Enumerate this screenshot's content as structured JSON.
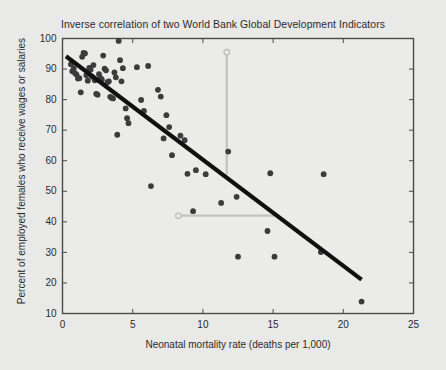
{
  "chart_data": {
    "type": "scatter",
    "title": "Inverse correlation of two World Bank Global Development Indicators",
    "xlabel": "Neonatal mortality rate (deaths per 1,000)",
    "ylabel": "Percent of employed females who receive wages or salaries",
    "xlim": [
      0,
      25
    ],
    "ylim": [
      10,
      100
    ],
    "xticks": [
      0,
      5,
      10,
      15,
      20,
      25
    ],
    "yticks": [
      10,
      20,
      30,
      40,
      50,
      60,
      70,
      80,
      90,
      100
    ],
    "grid": false,
    "legend": null,
    "point_color": "#3c3c3c",
    "trendline_color": "#111111",
    "guide_color": "#c2c2c2",
    "background_color": "#e9e9e7",
    "plot_background_color": "#ebebe9",
    "axis_color": "#4a4a4a",
    "points": [
      [
        0.6,
        91.6
      ],
      [
        0.7,
        89.3
      ],
      [
        0.8,
        90.2
      ],
      [
        0.9,
        88.6
      ],
      [
        1.0,
        88.2
      ],
      [
        1.1,
        86.9
      ],
      [
        1.2,
        87.0
      ],
      [
        1.3,
        82.4
      ],
      [
        1.4,
        94.0
      ],
      [
        1.5,
        95.3
      ],
      [
        1.6,
        95.1
      ],
      [
        1.7,
        88.0
      ],
      [
        1.8,
        86.2
      ],
      [
        1.9,
        90.4
      ],
      [
        2.0,
        89.8
      ],
      [
        2.1,
        87.5
      ],
      [
        2.2,
        91.3
      ],
      [
        2.3,
        86.3
      ],
      [
        2.4,
        81.9
      ],
      [
        2.5,
        81.6
      ],
      [
        2.6,
        88.3
      ],
      [
        2.7,
        87.1
      ],
      [
        2.8,
        86.6
      ],
      [
        2.9,
        94.4
      ],
      [
        3.0,
        90.1
      ],
      [
        3.1,
        89.6
      ],
      [
        3.2,
        85.7
      ],
      [
        3.3,
        86.0
      ],
      [
        3.4,
        80.9
      ],
      [
        3.5,
        80.6
      ],
      [
        3.6,
        80.4
      ],
      [
        3.7,
        88.9
      ],
      [
        3.8,
        87.3
      ],
      [
        3.9,
        68.5
      ],
      [
        4.0,
        99.2
      ],
      [
        4.1,
        92.9
      ],
      [
        4.2,
        86.0
      ],
      [
        4.3,
        90.3
      ],
      [
        4.5,
        77.1
      ],
      [
        4.6,
        73.9
      ],
      [
        4.7,
        72.3
      ],
      [
        5.3,
        90.6
      ],
      [
        5.6,
        79.9
      ],
      [
        5.8,
        76.3
      ],
      [
        6.1,
        91.0
      ],
      [
        6.3,
        51.7
      ],
      [
        6.8,
        83.2
      ],
      [
        7.0,
        81.0
      ],
      [
        7.2,
        67.3
      ],
      [
        7.4,
        74.9
      ],
      [
        7.6,
        71.0
      ],
      [
        7.8,
        61.8
      ],
      [
        8.4,
        68.2
      ],
      [
        8.7,
        66.7
      ],
      [
        8.9,
        55.7
      ],
      [
        9.3,
        43.5
      ],
      [
        9.5,
        56.9
      ],
      [
        10.2,
        55.6
      ],
      [
        11.3,
        46.2
      ],
      [
        11.8,
        63.0
      ],
      [
        12.4,
        48.2
      ],
      [
        12.5,
        28.6
      ],
      [
        14.6,
        37.0
      ],
      [
        14.8,
        55.9
      ],
      [
        15.1,
        28.6
      ],
      [
        18.4,
        30.1
      ],
      [
        18.6,
        55.6
      ],
      [
        21.3,
        13.9
      ]
    ],
    "trendline": {
      "x_start": 0.25,
      "y_start": 94.2,
      "x_end": 21.3,
      "y_end": 21.1
    },
    "annotations": [
      {
        "name": "vertical-guide",
        "orientation": "vertical",
        "marker_x": 11.7,
        "marker_y": 95.5,
        "end_x": 11.7,
        "end_y": 55.5
      },
      {
        "name": "horizontal-guide",
        "orientation": "horizontal",
        "marker_x": 8.25,
        "marker_y": 42.0,
        "end_x": 15.4,
        "end_y": 42.0
      }
    ]
  }
}
